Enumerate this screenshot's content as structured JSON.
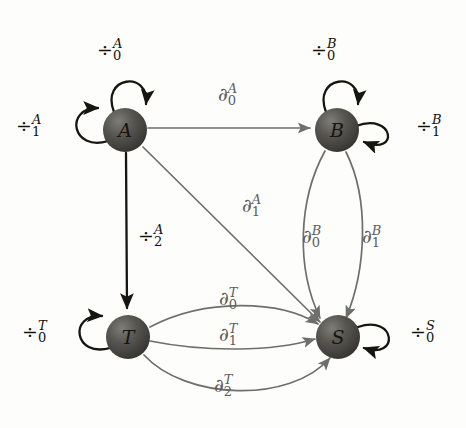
{
  "figure": {
    "kind": "automaton-state-diagram",
    "background_color": "#fdfdfb",
    "node_color": "#4a4845",
    "grey_edge_color": "#6e6e6c",
    "dark_edge_color": "#17150f"
  },
  "nodes": [
    {
      "id": "A",
      "label": "A",
      "cx": 125,
      "cy": 130,
      "r": 22
    },
    {
      "id": "B",
      "label": "B",
      "cx": 337,
      "cy": 130,
      "r": 22
    },
    {
      "id": "T",
      "label": "T",
      "cx": 128,
      "cy": 337,
      "r": 22
    },
    {
      "id": "S",
      "label": "S",
      "cx": 338,
      "cy": 337,
      "r": 22
    }
  ],
  "self_loops": [
    {
      "id": "loop-a-0",
      "node": "A",
      "base": "÷",
      "sup": "A",
      "sub": "0",
      "style": "dark"
    },
    {
      "id": "loop-a-1",
      "node": "A",
      "base": "÷",
      "sup": "A",
      "sub": "1",
      "style": "dark"
    },
    {
      "id": "loop-b-0",
      "node": "B",
      "base": "÷",
      "sup": "B",
      "sub": "0",
      "style": "dark"
    },
    {
      "id": "loop-b-1",
      "node": "B",
      "base": "÷",
      "sup": "B",
      "sub": "1",
      "style": "dark"
    },
    {
      "id": "loop-t-0",
      "node": "T",
      "base": "÷",
      "sup": "T",
      "sub": "0",
      "style": "dark"
    },
    {
      "id": "loop-s-0",
      "node": "S",
      "base": "÷",
      "sup": "S",
      "sub": "0",
      "style": "dark"
    }
  ],
  "edges": [
    {
      "id": "edge-a-b",
      "from": "A",
      "to": "B",
      "base": "∂",
      "sup": "A",
      "sub": "0",
      "style": "grey"
    },
    {
      "id": "edge-a-t",
      "from": "A",
      "to": "T",
      "base": "÷",
      "sup": "A",
      "sub": "2",
      "style": "dark"
    },
    {
      "id": "edge-a-s",
      "from": "A",
      "to": "S",
      "base": "∂",
      "sup": "A",
      "sub": "1",
      "style": "grey"
    },
    {
      "id": "edge-b-s-left",
      "from": "B",
      "to": "S",
      "base": "∂",
      "sup": "B",
      "sub": "0",
      "style": "grey"
    },
    {
      "id": "edge-b-s-right",
      "from": "B",
      "to": "S",
      "base": "∂",
      "sup": "B",
      "sub": "1",
      "style": "grey"
    },
    {
      "id": "edge-t-s-top",
      "from": "T",
      "to": "S",
      "base": "∂",
      "sup": "T",
      "sub": "0",
      "style": "grey"
    },
    {
      "id": "edge-t-s-middle",
      "from": "T",
      "to": "S",
      "base": "∂",
      "sup": "T",
      "sub": "1",
      "style": "grey"
    },
    {
      "id": "edge-t-s-bottom",
      "from": "T",
      "to": "S",
      "base": "∂",
      "sup": "T",
      "sub": "2",
      "style": "grey"
    }
  ],
  "labels": {
    "loop_a_0": {
      "base": "÷",
      "sup": "A",
      "sub": "0",
      "x": 97,
      "y": 40
    },
    "loop_a_1": {
      "base": "÷",
      "sup": "A",
      "sub": "1",
      "x": 16,
      "y": 116
    },
    "edge_a_b": {
      "base": "∂",
      "sup": "A",
      "sub": "0",
      "x": 218,
      "y": 85
    },
    "loop_b_0": {
      "base": "÷",
      "sup": "B",
      "sub": "0",
      "x": 311,
      "y": 40
    },
    "loop_b_1": {
      "base": "÷",
      "sup": "B",
      "sub": "1",
      "x": 416,
      "y": 116
    },
    "edge_a_s": {
      "base": "∂",
      "sup": "A",
      "sub": "1",
      "x": 242,
      "y": 196
    },
    "edge_a_t": {
      "base": "÷",
      "sup": "A",
      "sub": "2",
      "x": 138,
      "y": 226
    },
    "edge_b_s_left": {
      "base": "∂",
      "sup": "B",
      "sub": "0",
      "x": 302,
      "y": 227
    },
    "edge_b_s_right": {
      "base": "∂",
      "sup": "B",
      "sub": "1",
      "x": 362,
      "y": 227
    },
    "edge_t_s_top": {
      "base": "∂",
      "sup": "T",
      "sub": "0",
      "x": 219,
      "y": 289
    },
    "loop_t_0": {
      "base": "÷",
      "sup": "T",
      "sub": "0",
      "x": 22,
      "y": 322
    },
    "edge_t_s_middle": {
      "base": "∂",
      "sup": "T",
      "sub": "1",
      "x": 219,
      "y": 325
    },
    "loop_s_0": {
      "base": "÷",
      "sup": "S",
      "sub": "0",
      "x": 410,
      "y": 322
    },
    "edge_t_s_bottom": {
      "base": "∂",
      "sup": "T",
      "sub": "2",
      "x": 214,
      "y": 376
    }
  }
}
